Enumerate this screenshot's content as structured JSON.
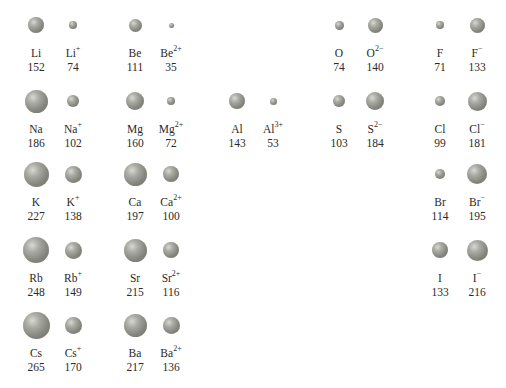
{
  "sphere_color": "#8a8c84",
  "rows": [
    {
      "y": 25,
      "items": [
        {
          "x": 36,
          "symbol": "Li",
          "charge": "",
          "radius": "152",
          "d": 16
        },
        {
          "x": 73,
          "symbol": "Li",
          "charge": "+",
          "radius": "74",
          "d": 8
        },
        {
          "x": 135,
          "symbol": "Be",
          "charge": "",
          "radius": "111",
          "d": 13
        },
        {
          "x": 171,
          "symbol": "Be",
          "charge": "2+",
          "radius": "35",
          "d": 5
        },
        {
          "x": 339,
          "symbol": "O",
          "charge": "",
          "radius": "74",
          "d": 9
        },
        {
          "x": 375,
          "symbol": "O",
          "charge": "2−",
          "radius": "140",
          "d": 15
        },
        {
          "x": 440,
          "symbol": "F",
          "charge": "",
          "radius": "71",
          "d": 8
        },
        {
          "x": 477,
          "symbol": "F",
          "charge": "−",
          "radius": "133",
          "d": 15
        }
      ]
    },
    {
      "y": 101,
      "items": [
        {
          "x": 36,
          "symbol": "Na",
          "charge": "",
          "radius": "186",
          "d": 23
        },
        {
          "x": 73,
          "symbol": "Na",
          "charge": "+",
          "radius": "102",
          "d": 12
        },
        {
          "x": 135,
          "symbol": "Mg",
          "charge": "",
          "radius": "160",
          "d": 18
        },
        {
          "x": 171,
          "symbol": "Mg",
          "charge": "2+",
          "radius": "72",
          "d": 8
        },
        {
          "x": 237,
          "symbol": "Al",
          "charge": "",
          "radius": "143",
          "d": 16
        },
        {
          "x": 273,
          "symbol": "Al",
          "charge": "3+",
          "radius": "53",
          "d": 7
        },
        {
          "x": 339,
          "symbol": "S",
          "charge": "",
          "radius": "103",
          "d": 12
        },
        {
          "x": 375,
          "symbol": "S",
          "charge": "2−",
          "radius": "184",
          "d": 18
        },
        {
          "x": 440,
          "symbol": "Cl",
          "charge": "",
          "radius": "99",
          "d": 10
        },
        {
          "x": 477,
          "symbol": "Cl",
          "charge": "−",
          "radius": "181",
          "d": 19
        }
      ]
    },
    {
      "y": 174,
      "items": [
        {
          "x": 36,
          "symbol": "K",
          "charge": "",
          "radius": "227",
          "d": 25
        },
        {
          "x": 73,
          "symbol": "K",
          "charge": "+",
          "radius": "138",
          "d": 17
        },
        {
          "x": 135,
          "symbol": "Ca",
          "charge": "",
          "radius": "197",
          "d": 23
        },
        {
          "x": 171,
          "symbol": "Ca",
          "charge": "2+",
          "radius": "100",
          "d": 16
        },
        {
          "x": 440,
          "symbol": "Br",
          "charge": "",
          "radius": "114",
          "d": 10
        },
        {
          "x": 477,
          "symbol": "Br",
          "charge": "−",
          "radius": "195",
          "d": 20
        }
      ]
    },
    {
      "y": 250,
      "items": [
        {
          "x": 36,
          "symbol": "Rb",
          "charge": "",
          "radius": "248",
          "d": 26
        },
        {
          "x": 73,
          "symbol": "Rb",
          "charge": "+",
          "radius": "149",
          "d": 17
        },
        {
          "x": 135,
          "symbol": "Sr",
          "charge": "",
          "radius": "215",
          "d": 23
        },
        {
          "x": 171,
          "symbol": "Sr",
          "charge": "2+",
          "radius": "116",
          "d": 16
        },
        {
          "x": 440,
          "symbol": "I",
          "charge": "",
          "radius": "133",
          "d": 16
        },
        {
          "x": 477,
          "symbol": "I",
          "charge": "−",
          "radius": "216",
          "d": 21
        }
      ]
    },
    {
      "y": 325,
      "items": [
        {
          "x": 36,
          "symbol": "Cs",
          "charge": "",
          "radius": "265",
          "d": 27
        },
        {
          "x": 73,
          "symbol": "Cs",
          "charge": "+",
          "radius": "170",
          "d": 17
        },
        {
          "x": 135,
          "symbol": "Ba",
          "charge": "",
          "radius": "217",
          "d": 23
        },
        {
          "x": 171,
          "symbol": "Ba",
          "charge": "2+",
          "radius": "136",
          "d": 17
        }
      ]
    }
  ]
}
